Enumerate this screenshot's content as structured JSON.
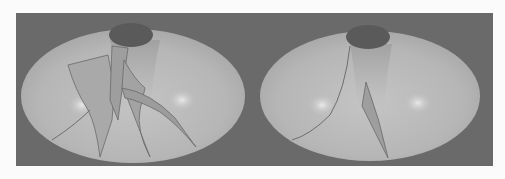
{
  "figure": {
    "background_color": "#6a6a6a",
    "surface_color": "#b8b8b8",
    "opening_color": "#5a5a5a",
    "panels": [
      {
        "id": "left",
        "label": "",
        "feature": "multiple folded sheets hanging from the top opening"
      },
      {
        "id": "right",
        "label": "",
        "feature": "single narrow wedge sheet and one curved seam line"
      }
    ]
  }
}
